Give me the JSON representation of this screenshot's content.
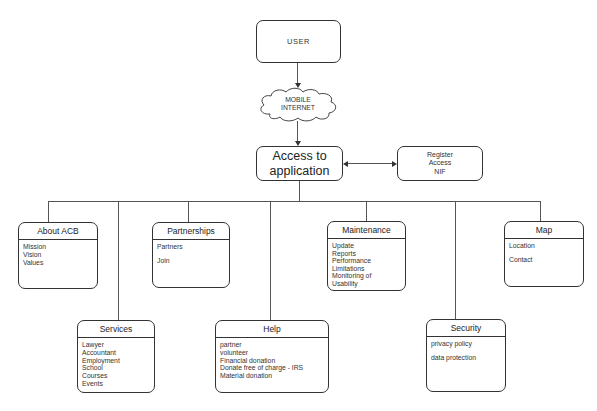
{
  "diagram": {
    "user": {
      "label": "USER"
    },
    "network": {
      "label": "MOBILE\nINTERNET",
      "shape": "cloud"
    },
    "access": {
      "label_line1": "Access to",
      "label_line2": "application"
    },
    "register": {
      "label": "Register\nAccess\nNIF"
    },
    "modules": [
      {
        "id": "about",
        "title": "About ACB",
        "items": [
          "Mission",
          "Vision",
          "Values"
        ]
      },
      {
        "id": "services",
        "title": "Services",
        "items": [
          "Lawyer",
          "Accountant",
          "Employment",
          "School",
          "Courses",
          "Events"
        ]
      },
      {
        "id": "partnerships",
        "title": "Partnerships",
        "items": [
          "Partners",
          "Join"
        ]
      },
      {
        "id": "help",
        "title": "Help",
        "items": [
          "partner",
          "volunteer",
          "Financial donation",
          "Donate free of charge - IRS",
          "Material donation"
        ]
      },
      {
        "id": "maintenance",
        "title": "Maintenance",
        "items": [
          "Update",
          "Reports",
          "Performance",
          "Limitations",
          "Monitoring of",
          "Usability"
        ]
      },
      {
        "id": "security",
        "title": "Security",
        "items": [
          "privacy policy",
          "data protection"
        ]
      },
      {
        "id": "map",
        "title": "Map",
        "items": [
          "Location",
          "Contact"
        ]
      }
    ],
    "colors": {
      "stroke": "#333333",
      "connector": "#555555",
      "background": "#ffffff"
    }
  }
}
